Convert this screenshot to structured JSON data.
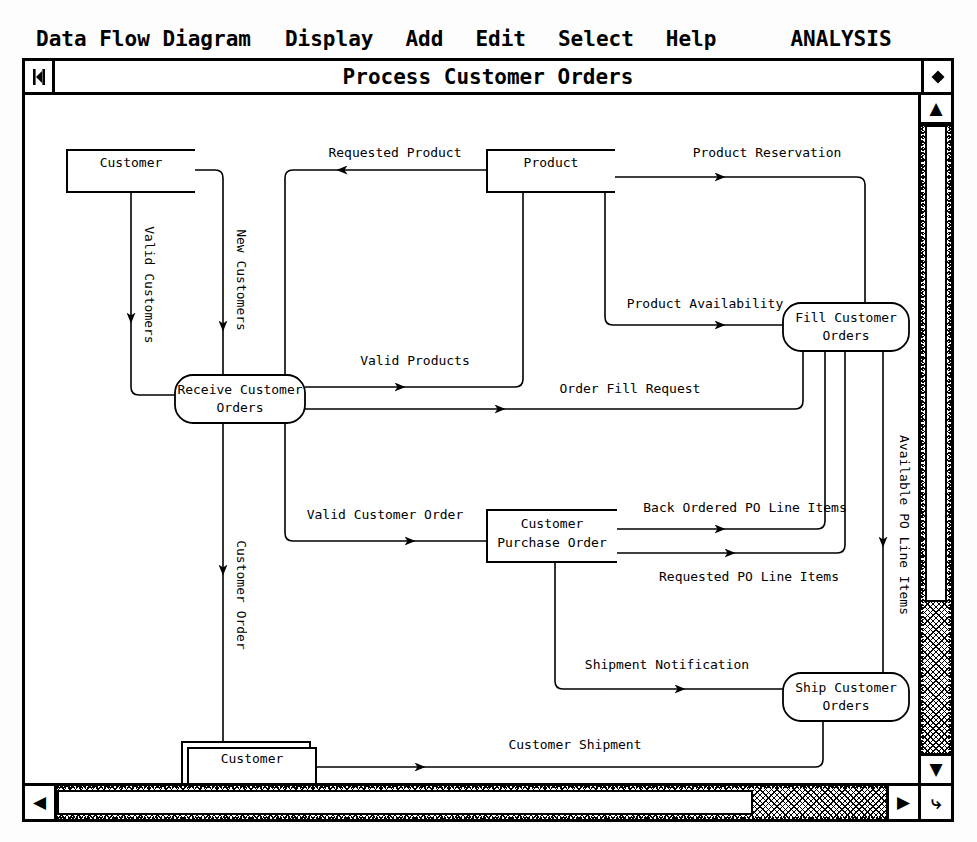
{
  "menu": {
    "items": [
      {
        "label": "Data Flow Diagram",
        "name": "menu-data-flow-diagram"
      },
      {
        "label": "Display",
        "name": "menu-display"
      },
      {
        "label": "Add",
        "name": "menu-add"
      },
      {
        "label": "Edit",
        "name": "menu-edit"
      },
      {
        "label": "Select",
        "name": "menu-select"
      },
      {
        "label": "Help",
        "name": "menu-help"
      }
    ],
    "mode_label": "ANALYSIS"
  },
  "window": {
    "title": "Process Customer Orders",
    "left_icon": "window-menu-icon",
    "right_icon": "window-resize-icon",
    "scrollbars": {
      "v_up": "▲",
      "v_down": "▼",
      "h_left": "◀",
      "h_right": "▶",
      "corner": "⤷"
    }
  },
  "diagram": {
    "type": "data-flow-diagram",
    "stores": [
      {
        "id": "customer-store",
        "label": "Customer",
        "style": "open-ended",
        "x": 42,
        "y": 55,
        "w": 128,
        "h": 42
      },
      {
        "id": "product-store",
        "label": "Product",
        "style": "open-ended",
        "x": 462,
        "y": 55,
        "w": 128,
        "h": 42
      },
      {
        "id": "customer-purchase-order-store",
        "label_line1": "Customer",
        "label_line2": "Purchase Order",
        "style": "open-ended",
        "x": 462,
        "y": 415,
        "w": 130,
        "h": 52
      }
    ],
    "entities": [
      {
        "id": "customer-entity",
        "label": "Customer",
        "style": "shadowed-box",
        "x": 160,
        "y": 650,
        "w": 128,
        "h": 44
      }
    ],
    "processes": [
      {
        "id": "receive-customer-orders",
        "label_line1": "Receive Customer",
        "label_line2": "Orders",
        "x": 150,
        "y": 280,
        "w": 130,
        "h": 48
      },
      {
        "id": "fill-customer-orders",
        "label_line1": "Fill Customer",
        "label_line2": "Orders",
        "x": 758,
        "y": 208,
        "w": 126,
        "h": 48
      },
      {
        "id": "ship-customer-orders",
        "label_line1": "Ship Customer",
        "label_line2": "Orders",
        "x": 758,
        "y": 578,
        "w": 126,
        "h": 48
      }
    ],
    "flows": [
      {
        "id": "valid-customers",
        "label": "Valid Customers",
        "orientation": "vertical",
        "from": "customer-store",
        "to": "receive-customer-orders"
      },
      {
        "id": "new-customers",
        "label": "New Customers",
        "orientation": "vertical",
        "from": "customer-store",
        "to": "receive-customer-orders"
      },
      {
        "id": "requested-product",
        "label": "Requested Product",
        "orientation": "horizontal",
        "from": "product-store",
        "to": "receive-customer-orders"
      },
      {
        "id": "product-reservation",
        "label": "Product Reservation",
        "orientation": "horizontal",
        "from": "product-store",
        "to": "fill-customer-orders"
      },
      {
        "id": "product-availability",
        "label": "Product Availability",
        "orientation": "horizontal",
        "from": "product-store",
        "to": "fill-customer-orders"
      },
      {
        "id": "valid-products",
        "label": "Valid Products",
        "orientation": "horizontal",
        "from": "receive-customer-orders",
        "to": "product-store"
      },
      {
        "id": "order-fill-request",
        "label": "Order Fill Request",
        "orientation": "horizontal",
        "from": "receive-customer-orders",
        "to": "fill-customer-orders"
      },
      {
        "id": "customer-order",
        "label": "Customer Order",
        "orientation": "vertical",
        "from": "receive-customer-orders",
        "to": "customer-entity"
      },
      {
        "id": "valid-customer-order",
        "label": "Valid Customer Order",
        "orientation": "horizontal",
        "from": "receive-customer-orders",
        "to": "customer-purchase-order-store"
      },
      {
        "id": "back-ordered-po-line-items",
        "label": "Back Ordered PO Line Items",
        "orientation": "horizontal",
        "from": "customer-purchase-order-store",
        "to": "fill-customer-orders"
      },
      {
        "id": "requested-po-line-items",
        "label": "Requested PO Line Items",
        "orientation": "horizontal",
        "from": "customer-purchase-order-store",
        "to": "fill-customer-orders"
      },
      {
        "id": "available-po-line-items",
        "label": "Available PO Line Items",
        "orientation": "vertical",
        "from": "fill-customer-orders",
        "to": "ship-customer-orders"
      },
      {
        "id": "shipment-notification",
        "label": "Shipment Notification",
        "orientation": "horizontal",
        "from": "customer-purchase-order-store",
        "to": "ship-customer-orders"
      },
      {
        "id": "customer-shipment",
        "label": "Customer Shipment",
        "orientation": "horizontal",
        "from": "customer-entity",
        "to": "ship-customer-orders"
      }
    ]
  }
}
